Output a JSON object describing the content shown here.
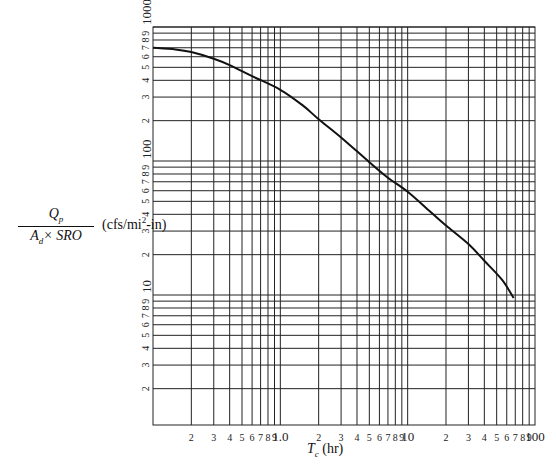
{
  "chart_data": {
    "type": "line",
    "title": "",
    "xlabel": {
      "symbol": "T",
      "subscript": "c",
      "units": "(hr)"
    },
    "ylabel": {
      "numerator": "Q",
      "numerator_sub": "p",
      "denominator_a": "A",
      "denominator_a_sub": "d",
      "denominator_rest": "× SRO",
      "units_pre": "(cfs/mi",
      "units_sup": "2",
      "units_post": "-in)"
    },
    "xscale": "log",
    "yscale": "log",
    "xlim": [
      0.1,
      100
    ],
    "ylim": [
      1,
      1000
    ],
    "grid": true,
    "x_tick_labels": [
      {
        "value": 0.2,
        "label": "2"
      },
      {
        "value": 0.3,
        "label": "3"
      },
      {
        "value": 0.4,
        "label": "4"
      },
      {
        "value": 0.5,
        "label": "5"
      },
      {
        "value": 0.6,
        "label": "6"
      },
      {
        "value": 0.7,
        "label": "7"
      },
      {
        "value": 0.8,
        "label": "8"
      },
      {
        "value": 0.9,
        "label": "9"
      },
      {
        "value": 1,
        "label": "1.0",
        "major": true
      },
      {
        "value": 2,
        "label": "2"
      },
      {
        "value": 3,
        "label": "3"
      },
      {
        "value": 4,
        "label": "4"
      },
      {
        "value": 5,
        "label": "5"
      },
      {
        "value": 6,
        "label": "6"
      },
      {
        "value": 7,
        "label": "7"
      },
      {
        "value": 8,
        "label": "8"
      },
      {
        "value": 9,
        "label": "9"
      },
      {
        "value": 10,
        "label": "10",
        "major": true
      },
      {
        "value": 20,
        "label": "2"
      },
      {
        "value": 30,
        "label": "3"
      },
      {
        "value": 40,
        "label": "4"
      },
      {
        "value": 50,
        "label": "5"
      },
      {
        "value": 60,
        "label": "6"
      },
      {
        "value": 70,
        "label": "7"
      },
      {
        "value": 80,
        "label": "8"
      },
      {
        "value": 90,
        "label": "9"
      },
      {
        "value": 100,
        "label": "100",
        "major": true
      }
    ],
    "y_tick_labels": [
      {
        "value": 2,
        "label": "2"
      },
      {
        "value": 3,
        "label": "3"
      },
      {
        "value": 4,
        "label": "4"
      },
      {
        "value": 5,
        "label": "5"
      },
      {
        "value": 6,
        "label": "6"
      },
      {
        "value": 7,
        "label": "7"
      },
      {
        "value": 8,
        "label": "8"
      },
      {
        "value": 9,
        "label": "9"
      },
      {
        "value": 10,
        "label": "10",
        "major": true
      },
      {
        "value": 20,
        "label": "2"
      },
      {
        "value": 30,
        "label": "3"
      },
      {
        "value": 40,
        "label": "4"
      },
      {
        "value": 50,
        "label": "5"
      },
      {
        "value": 60,
        "label": "6"
      },
      {
        "value": 70,
        "label": "7"
      },
      {
        "value": 80,
        "label": "8"
      },
      {
        "value": 90,
        "label": "9"
      },
      {
        "value": 100,
        "label": "100",
        "major": true
      },
      {
        "value": 200,
        "label": "2"
      },
      {
        "value": 300,
        "label": "3"
      },
      {
        "value": 400,
        "label": "4"
      },
      {
        "value": 500,
        "label": "5"
      },
      {
        "value": 600,
        "label": "6"
      },
      {
        "value": 700,
        "label": "7"
      },
      {
        "value": 800,
        "label": "8"
      },
      {
        "value": 900,
        "label": "9"
      },
      {
        "value": 1000,
        "label": "1000",
        "major": true
      }
    ],
    "series": [
      {
        "name": "Qp/(Ad×SRO) vs Tc",
        "x": [
          0.1,
          0.15,
          0.2,
          0.3,
          0.4,
          0.6,
          1.0,
          1.5,
          2,
          3,
          5,
          7,
          10,
          15,
          20,
          30,
          40,
          55,
          68
        ],
        "y": [
          700,
          680,
          650,
          580,
          520,
          430,
          340,
          260,
          205,
          150,
          98,
          75,
          59,
          42,
          33,
          24,
          18,
          13,
          9.5
        ]
      }
    ]
  }
}
